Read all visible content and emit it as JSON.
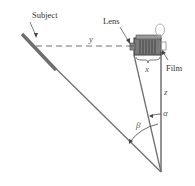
{
  "diagram": {
    "labels": {
      "subject": "Subject",
      "lens": "Lens",
      "film": "Film",
      "y": "y",
      "x": "x",
      "z": "z",
      "alpha": "α",
      "beta": "β"
    },
    "colors": {
      "line": "#707070",
      "subject_bar": "#6e6e6e",
      "text": "#333333",
      "camera_body": "#5a5a5a"
    }
  }
}
